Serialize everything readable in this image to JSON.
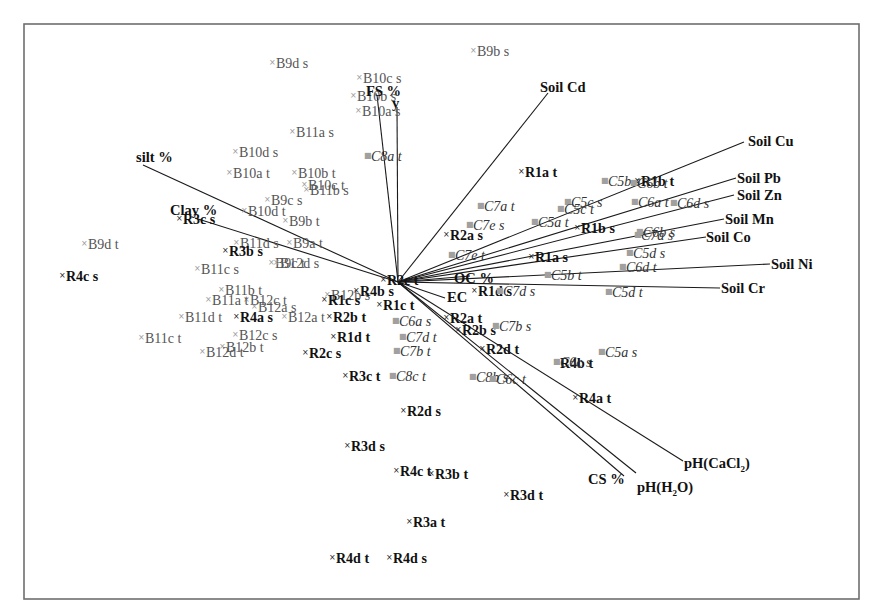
{
  "chart_data": {
    "type": "scatter",
    "subtype": "pca-biplot",
    "title": "",
    "xlabel": "",
    "ylabel": "",
    "grid": false,
    "legend": "none",
    "origin_px": [
      398,
      282
    ],
    "frame_px": {
      "x": 24,
      "y": 24,
      "width": 835,
      "height": 575
    },
    "vectors": [
      {
        "name": "FS %",
        "end": [
          377,
          95
        ],
        "label_pos": [
          366,
          96
        ]
      },
      {
        "name": "y",
        "end": [
          397,
          107
        ],
        "label_pos": [
          392,
          108
        ]
      },
      {
        "name": "Soil Cd",
        "end": [
          548,
          93
        ],
        "label_pos": [
          540,
          92
        ]
      },
      {
        "name": "Soil Cu",
        "end": [
          744,
          142
        ],
        "label_pos": [
          748,
          146
        ]
      },
      {
        "name": "silt %",
        "end": [
          143,
          165
        ],
        "label_pos": [
          136,
          162
        ]
      },
      {
        "name": "Clay %",
        "end": [
          195,
          218
        ],
        "label_pos": [
          170,
          215
        ]
      },
      {
        "name": "Soil Pb",
        "end": [
          736,
          178
        ],
        "label_pos": [
          737,
          183
        ]
      },
      {
        "name": "Soil Zn",
        "end": [
          734,
          195
        ],
        "label_pos": [
          737,
          200
        ]
      },
      {
        "name": "Soil Mn",
        "end": [
          724,
          219
        ],
        "label_pos": [
          725,
          224
        ]
      },
      {
        "name": "Soil Co",
        "end": [
          706,
          237
        ],
        "label_pos": [
          706,
          242
        ]
      },
      {
        "name": "Soil Ni",
        "end": [
          770,
          264
        ],
        "label_pos": [
          771,
          269
        ]
      },
      {
        "name": "Soil Cr",
        "end": [
          720,
          288
        ],
        "label_pos": [
          721,
          293
        ]
      },
      {
        "name": "OC %",
        "end": [
          470,
          276
        ],
        "label_pos": [
          454,
          283
        ]
      },
      {
        "name": "EC",
        "end": [
          445,
          298
        ],
        "label_pos": [
          447,
          302
        ]
      },
      {
        "name": "pH(CaCl₂)",
        "end": [
          683,
          461
        ],
        "label_pos": [
          684,
          468
        ]
      },
      {
        "name": "pH(H₂O)",
        "end": [
          636,
          473
        ],
        "label_pos": [
          637,
          492
        ]
      },
      {
        "name": "CS %",
        "end": [
          624,
          476
        ],
        "label_pos": [
          588,
          484
        ]
      }
    ],
    "points": [
      {
        "label": "B9d s",
        "group": "B",
        "pos": [
          276,
          68
        ]
      },
      {
        "label": "B10c s",
        "group": "B",
        "pos": [
          363,
          83
        ]
      },
      {
        "label": "B10b s",
        "group": "B",
        "pos": [
          357,
          101
        ]
      },
      {
        "label": "B10a s",
        "group": "B",
        "pos": [
          362,
          116
        ]
      },
      {
        "label": "B11a s",
        "group": "B",
        "pos": [
          296,
          137
        ]
      },
      {
        "label": "B9b s",
        "group": "B",
        "pos": [
          477,
          56
        ]
      },
      {
        "label": "B10d s",
        "group": "B",
        "pos": [
          239,
          157
        ]
      },
      {
        "label": "B10a t",
        "group": "B",
        "pos": [
          233,
          178
        ]
      },
      {
        "label": "B10b t",
        "group": "B",
        "pos": [
          298,
          178
        ]
      },
      {
        "label": "B10c t",
        "group": "B",
        "pos": [
          308,
          190
        ]
      },
      {
        "label": "B11b s",
        "group": "B",
        "pos": [
          310,
          195
        ]
      },
      {
        "label": "B9c s",
        "group": "B",
        "pos": [
          271,
          205
        ]
      },
      {
        "label": "B10d t",
        "group": "B",
        "pos": [
          248,
          216
        ]
      },
      {
        "label": "B9b t",
        "group": "B",
        "pos": [
          289,
          226
        ]
      },
      {
        "label": "B9d t",
        "group": "B",
        "pos": [
          88,
          249
        ]
      },
      {
        "label": "B11d s",
        "group": "B",
        "pos": [
          240,
          248
        ]
      },
      {
        "label": "B9a t",
        "group": "B",
        "pos": [
          293,
          248
        ]
      },
      {
        "label": "B9c t",
        "group": "B",
        "pos": [
          275,
          268
        ]
      },
      {
        "label": "B12d s",
        "group": "B",
        "pos": [
          280,
          268
        ]
      },
      {
        "label": "B11c s",
        "group": "B",
        "pos": [
          201,
          274
        ]
      },
      {
        "label": "B11b t",
        "group": "B",
        "pos": [
          225,
          295
        ]
      },
      {
        "label": "B12b s",
        "group": "B",
        "pos": [
          331,
          300
        ]
      },
      {
        "label": "B12c t",
        "group": "B",
        "pos": [
          250,
          305
        ]
      },
      {
        "label": "B11a t",
        "group": "B",
        "pos": [
          212,
          305
        ]
      },
      {
        "label": "B12a s",
        "group": "B",
        "pos": [
          258,
          312
        ]
      },
      {
        "label": "B11d t",
        "group": "B",
        "pos": [
          185,
          322
        ]
      },
      {
        "label": "B12a t",
        "group": "B",
        "pos": [
          288,
          322
        ]
      },
      {
        "label": "B11c t",
        "group": "B",
        "pos": [
          145,
          343
        ]
      },
      {
        "label": "B12c s",
        "group": "B",
        "pos": [
          239,
          340
        ]
      },
      {
        "label": "B12b t",
        "group": "B",
        "pos": [
          226,
          352
        ]
      },
      {
        "label": "B12d t",
        "group": "B",
        "pos": [
          206,
          357
        ]
      },
      {
        "label": "R1a t",
        "group": "R",
        "pos": [
          525,
          177
        ]
      },
      {
        "label": "R1b t",
        "group": "R",
        "pos": [
          641,
          186
        ]
      },
      {
        "label": "R3c s",
        "group": "R",
        "pos": [
          183,
          224
        ]
      },
      {
        "label": "R2a s",
        "group": "R",
        "pos": [
          450,
          240
        ]
      },
      {
        "label": "R1b s",
        "group": "R",
        "pos": [
          581,
          233
        ]
      },
      {
        "label": "R3b s",
        "group": "R",
        "pos": [
          229,
          256
        ]
      },
      {
        "label": "R1a s",
        "group": "R",
        "pos": [
          535,
          262
        ]
      },
      {
        "label": "R4c s",
        "group": "R",
        "pos": [
          66,
          281
        ]
      },
      {
        "label": "R2c t",
        "group": "R",
        "pos": [
          387,
          285
        ]
      },
      {
        "label": "R4b s",
        "group": "R",
        "pos": [
          360,
          296
        ]
      },
      {
        "label": "R1d s",
        "group": "R",
        "pos": [
          478,
          296
        ]
      },
      {
        "label": "R1c s",
        "group": "R",
        "pos": [
          328,
          305
        ]
      },
      {
        "label": "R1c t",
        "group": "R",
        "pos": [
          383,
          310
        ]
      },
      {
        "label": "R4a s",
        "group": "R",
        "pos": [
          240,
          322
        ]
      },
      {
        "label": "R2b t",
        "group": "R",
        "pos": [
          333,
          322
        ]
      },
      {
        "label": "R2a t",
        "group": "R",
        "pos": [
          450,
          323
        ]
      },
      {
        "label": "R2b s",
        "group": "R",
        "pos": [
          462,
          335
        ]
      },
      {
        "label": "R1d t",
        "group": "R",
        "pos": [
          337,
          342
        ]
      },
      {
        "label": "R2c s",
        "group": "R",
        "pos": [
          309,
          358
        ]
      },
      {
        "label": "R2d t",
        "group": "R",
        "pos": [
          486,
          354
        ]
      },
      {
        "label": "R4b t",
        "group": "R",
        "pos": [
          560,
          368
        ]
      },
      {
        "label": "R3c t",
        "group": "R",
        "pos": [
          349,
          381
        ]
      },
      {
        "label": "R4a t",
        "group": "R",
        "pos": [
          579,
          403
        ]
      },
      {
        "label": "R2d s",
        "group": "R",
        "pos": [
          407,
          416
        ]
      },
      {
        "label": "R3d s",
        "group": "R",
        "pos": [
          351,
          451
        ]
      },
      {
        "label": "R4c t",
        "group": "R",
        "pos": [
          400,
          476
        ]
      },
      {
        "label": "R3b t",
        "group": "R",
        "pos": [
          435,
          479
        ]
      },
      {
        "label": "R3d t",
        "group": "R",
        "pos": [
          510,
          500
        ]
      },
      {
        "label": "R3a t",
        "group": "R",
        "pos": [
          413,
          527
        ]
      },
      {
        "label": "R4d t",
        "group": "R",
        "pos": [
          336,
          563
        ]
      },
      {
        "label": "R4d s",
        "group": "R",
        "pos": [
          393,
          563
        ]
      },
      {
        "label": "C8a t",
        "group": "C",
        "pos": [
          371,
          161
        ]
      },
      {
        "label": "C5b s",
        "group": "C",
        "pos": [
          608,
          186
        ]
      },
      {
        "label": "C6b t",
        "group": "C",
        "pos": [
          637,
          188
        ]
      },
      {
        "label": "C7a t",
        "group": "C",
        "pos": [
          484,
          211
        ]
      },
      {
        "label": "C5c s",
        "group": "C",
        "pos": [
          571,
          207
        ]
      },
      {
        "label": "C6a t",
        "group": "C",
        "pos": [
          638,
          207
        ]
      },
      {
        "label": "C5c t",
        "group": "C",
        "pos": [
          564,
          214
        ]
      },
      {
        "label": "C6d s",
        "group": "C",
        "pos": [
          677,
          208
        ]
      },
      {
        "label": "C7e s",
        "group": "C",
        "pos": [
          473,
          230
        ]
      },
      {
        "label": "C5a t",
        "group": "C",
        "pos": [
          538,
          227
        ]
      },
      {
        "label": "C7a s",
        "group": "C",
        "pos": [
          641,
          240
        ]
      },
      {
        "label": "C6b s",
        "group": "C",
        "pos": [
          643,
          237
        ]
      },
      {
        "label": "C7e t",
        "group": "C",
        "pos": [
          455,
          260
        ]
      },
      {
        "label": "C5d s",
        "group": "C",
        "pos": [
          633,
          258
        ]
      },
      {
        "label": "C6d t",
        "group": "C",
        "pos": [
          626,
          272
        ]
      },
      {
        "label": "C5b t",
        "group": "C",
        "pos": [
          551,
          280
        ]
      },
      {
        "label": "C5d t",
        "group": "C",
        "pos": [
          612,
          297
        ]
      },
      {
        "label": "C7d s",
        "group": "C",
        "pos": [
          503,
          296
        ]
      },
      {
        "label": "C6a s",
        "group": "C",
        "pos": [
          399,
          326
        ]
      },
      {
        "label": "C7b s",
        "group": "C",
        "pos": [
          499,
          331
        ]
      },
      {
        "label": "C7d t",
        "group": "C",
        "pos": [
          406,
          342
        ]
      },
      {
        "label": "C7b t",
        "group": "C",
        "pos": [
          400,
          356
        ]
      },
      {
        "label": "C6c s",
        "group": "C",
        "pos": [
          560,
          367
        ]
      },
      {
        "label": "C5a s",
        "group": "C",
        "pos": [
          605,
          357
        ]
      },
      {
        "label": "C8c t",
        "group": "C",
        "pos": [
          396,
          381
        ]
      },
      {
        "label": "C8b s",
        "group": "C",
        "pos": [
          476,
          382
        ]
      },
      {
        "label": "C6c t",
        "group": "C",
        "pos": [
          496,
          384
        ]
      }
    ],
    "groups": {
      "B": {
        "style": "regular",
        "color": "#555555",
        "marker_color": "#9a9a9a"
      },
      "R": {
        "style": "bold",
        "color": "#111111",
        "marker_color": "#222222"
      },
      "C": {
        "style": "italic",
        "color": "#333333",
        "marker_color": "#a0a0a0"
      }
    }
  }
}
